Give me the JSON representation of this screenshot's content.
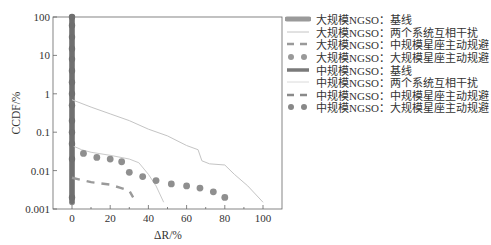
{
  "chart_data": {
    "type": "line",
    "title": "",
    "xlabel": "ΔR/%",
    "ylabel": "CCDF/%",
    "xlim": [
      -8,
      110
    ],
    "ylim": [
      0.001,
      100
    ],
    "yscale": "log",
    "xticks": [
      "0",
      "20",
      "40",
      "60",
      "80",
      "100"
    ],
    "yticks": [
      "0.001",
      "0.01",
      "0.1",
      "1",
      "10",
      "100"
    ],
    "grid": false,
    "legend_position": "right, outside plot",
    "series": [
      {
        "name": "大规模NGSO：基线",
        "style": "thick-line",
        "color": "#8a8a8a",
        "x": [
          0,
          0
        ],
        "y": [
          100,
          0.0015
        ]
      },
      {
        "name": "大规模NGSO：两个系统互相干扰",
        "style": "thin-line",
        "color": "#c4c4c4",
        "x": [
          0,
          10,
          20,
          30,
          40,
          50,
          60,
          66,
          68,
          72,
          80,
          85,
          92,
          100
        ],
        "y": [
          0.7,
          0.45,
          0.3,
          0.2,
          0.12,
          0.08,
          0.045,
          0.035,
          0.018,
          0.015,
          0.014,
          0.008,
          0.004,
          0.0015
        ]
      },
      {
        "name": "大规模NGSO：中规模星座主动规避",
        "style": "dashed",
        "color": "#9a9a9a",
        "x": [
          0,
          10,
          20,
          25,
          30,
          32
        ],
        "y": [
          0.0065,
          0.005,
          0.0043,
          0.0036,
          0.003,
          0.002
        ]
      },
      {
        "name": "大规模NGSO：大规模星座主动规避",
        "style": "dots",
        "color": "#8f8f8f",
        "x": [
          6,
          13,
          20,
          26,
          30,
          37,
          44,
          52,
          60,
          67,
          74,
          80
        ],
        "y": [
          0.028,
          0.022,
          0.02,
          0.017,
          0.009,
          0.007,
          0.0055,
          0.0045,
          0.004,
          0.0035,
          0.0028,
          0.002
        ]
      },
      {
        "name": "中规模NGSO：基线",
        "style": "thick-line",
        "color": "#707070",
        "x": [
          0,
          0
        ],
        "y": [
          100,
          0.0015
        ]
      },
      {
        "name": "中规模NGSO：两个系统互相干扰",
        "style": "thin-line",
        "color": "#c9c9c9",
        "x": [
          0,
          5,
          10,
          20,
          30,
          35,
          40,
          44,
          48
        ],
        "y": [
          0.045,
          0.035,
          0.03,
          0.025,
          0.02,
          0.016,
          0.008,
          0.004,
          0.0015
        ]
      },
      {
        "name": "中规模NGSO：中规模星座主动规避",
        "style": "dashed",
        "color": "#8a8a8a",
        "x": [
          0,
          0
        ],
        "y": [
          0.0065,
          0.0065
        ]
      },
      {
        "name": "中规模NGSO：大规模星座主动规避",
        "style": "dots",
        "color": "#6f6f6f",
        "x": [
          0,
          0,
          0,
          0,
          0,
          0,
          0,
          0,
          0,
          0,
          0,
          0,
          0,
          0
        ],
        "y": [
          100,
          60,
          30,
          15,
          8,
          4,
          2,
          1,
          0.5,
          0.2,
          0.1,
          0.05,
          0.02,
          0.002
        ]
      }
    ]
  },
  "axes": {
    "xlabel": "ΔR/%",
    "ylabel": "CCDF/%",
    "xticks": [
      "0",
      "20",
      "40",
      "60",
      "80",
      "100"
    ],
    "yticks": [
      "100",
      "10",
      "1",
      "0.1",
      "0.01",
      "0.001"
    ]
  },
  "legend": {
    "items": [
      {
        "label": "大规模NGSO：基线"
      },
      {
        "label": "大规模NGSO：两个系统互相干扰"
      },
      {
        "label": "大规模NGSO：中规模星座主动规避"
      },
      {
        "label": "大规模NGSO：大规模星座主动规避"
      },
      {
        "label": "中规模NGSO：基线"
      },
      {
        "label": "中规模NGSO：两个系统互相干扰"
      },
      {
        "label": "中规模NGSO：中规模星座主动规避"
      },
      {
        "label": "中规模NGSO：大规模星座主动规避"
      }
    ]
  }
}
